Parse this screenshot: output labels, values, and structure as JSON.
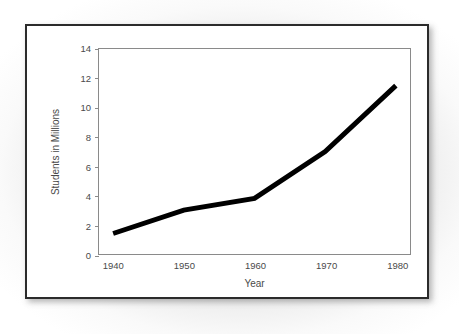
{
  "chart_data": {
    "type": "line",
    "title": "",
    "xlabel": "Year",
    "ylabel": "Students in Millions",
    "x": [
      1940,
      1950,
      1960,
      1970,
      1980
    ],
    "categories": [
      "1940",
      "1950",
      "1960",
      "1970",
      "1980"
    ],
    "values": [
      1.4,
      3.0,
      3.8,
      7.0,
      11.5
    ],
    "series": [
      {
        "name": "Students in Millions",
        "values": [
          1.4,
          3.0,
          3.8,
          7.0,
          11.5
        ],
        "color": "#000000"
      }
    ],
    "xlim": [
      1938,
      1982
    ],
    "ylim": [
      0,
      14
    ],
    "yticks": [
      0,
      2,
      4,
      6,
      8,
      10,
      12,
      14
    ],
    "ytick_labels": [
      "0",
      "2",
      "4",
      "6",
      "8",
      "10",
      "12",
      "14"
    ],
    "xticks": [
      1940,
      1950,
      1960,
      1970,
      1980
    ],
    "xtick_labels": [
      "1940",
      "1950",
      "1960",
      "1970",
      "1980"
    ],
    "grid": false,
    "legend": false,
    "legend_position": "none",
    "line_width_px": 5,
    "plot_border_color": "#8a8a8a",
    "axis_text_color": "#4a4a4a",
    "frame_color": "#2b2b2b",
    "background_color": "#ffffff"
  }
}
